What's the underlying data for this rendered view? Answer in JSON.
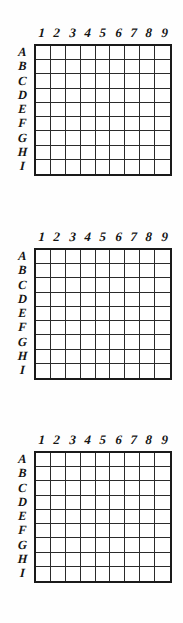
{
  "page": {
    "background_color": "#ffffff",
    "ink_color": "#1a1a1a",
    "grid_line_color": "#2b2b2b"
  },
  "grids": [
    {
      "name": "grid-1",
      "columns": [
        "1",
        "2",
        "3",
        "4",
        "5",
        "6",
        "7",
        "8",
        "9"
      ],
      "rows": [
        "A",
        "B",
        "C",
        "D",
        "E",
        "F",
        "G",
        "H",
        "I"
      ],
      "cells": [
        [
          "",
          "",
          "",
          "",
          "",
          "",
          "",
          "",
          ""
        ],
        [
          "",
          "",
          "",
          "",
          "",
          "",
          "",
          "",
          ""
        ],
        [
          "",
          "",
          "",
          "",
          "",
          "",
          "",
          "",
          ""
        ],
        [
          "",
          "",
          "",
          "",
          "",
          "",
          "",
          "",
          ""
        ],
        [
          "",
          "",
          "",
          "",
          "",
          "",
          "",
          "",
          ""
        ],
        [
          "",
          "",
          "",
          "",
          "",
          "",
          "",
          "",
          ""
        ],
        [
          "",
          "",
          "",
          "",
          "",
          "",
          "",
          "",
          ""
        ],
        [
          "",
          "",
          "",
          "",
          "",
          "",
          "",
          "",
          ""
        ],
        [
          "",
          "",
          "",
          "",
          "",
          "",
          "",
          "",
          ""
        ]
      ]
    },
    {
      "name": "grid-2",
      "columns": [
        "1",
        "2",
        "3",
        "4",
        "5",
        "6",
        "7",
        "8",
        "9"
      ],
      "rows": [
        "A",
        "B",
        "C",
        "D",
        "E",
        "F",
        "G",
        "H",
        "I"
      ],
      "cells": [
        [
          "",
          "",
          "",
          "",
          "",
          "",
          "",
          "",
          ""
        ],
        [
          "",
          "",
          "",
          "",
          "",
          "",
          "",
          "",
          ""
        ],
        [
          "",
          "",
          "",
          "",
          "",
          "",
          "",
          "",
          ""
        ],
        [
          "",
          "",
          "",
          "",
          "",
          "",
          "",
          "",
          ""
        ],
        [
          "",
          "",
          "",
          "",
          "",
          "",
          "",
          "",
          ""
        ],
        [
          "",
          "",
          "",
          "",
          "",
          "",
          "",
          "",
          ""
        ],
        [
          "",
          "",
          "",
          "",
          "",
          "",
          "",
          "",
          ""
        ],
        [
          "",
          "",
          "",
          "",
          "",
          "",
          "",
          "",
          ""
        ],
        [
          "",
          "",
          "",
          "",
          "",
          "",
          "",
          "",
          ""
        ]
      ]
    },
    {
      "name": "grid-3",
      "columns": [
        "1",
        "2",
        "3",
        "4",
        "5",
        "6",
        "7",
        "8",
        "9"
      ],
      "rows": [
        "A",
        "B",
        "C",
        "D",
        "E",
        "F",
        "G",
        "H",
        "I"
      ],
      "cells": [
        [
          "",
          "",
          "",
          "",
          "",
          "",
          "",
          "",
          ""
        ],
        [
          "",
          "",
          "",
          "",
          "",
          "",
          "",
          "",
          ""
        ],
        [
          "",
          "",
          "",
          "",
          "",
          "",
          "",
          "",
          ""
        ],
        [
          "",
          "",
          "",
          "",
          "",
          "",
          "",
          "",
          ""
        ],
        [
          "",
          "",
          "",
          "",
          "",
          "",
          "",
          "",
          ""
        ],
        [
          "",
          "",
          "",
          "",
          "",
          "",
          "",
          "",
          ""
        ],
        [
          "",
          "",
          "",
          "",
          "",
          "",
          "",
          "",
          ""
        ],
        [
          "",
          "",
          "",
          "",
          "",
          "",
          "",
          "",
          ""
        ],
        [
          "",
          "",
          "",
          "",
          "",
          "",
          "",
          "",
          ""
        ]
      ]
    }
  ]
}
